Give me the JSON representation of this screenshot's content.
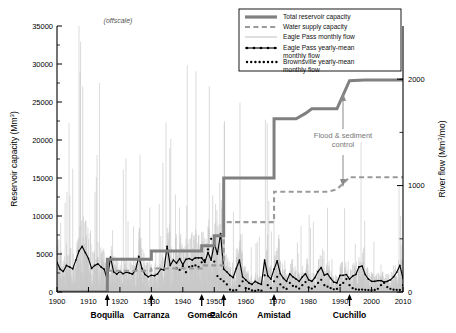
{
  "figure": {
    "offscale_note": "(offscale)",
    "annotation": {
      "line1": "Flood & sediment",
      "line2": "control"
    }
  },
  "axes": {
    "left": {
      "title": "Reservoir capacity (Mm",
      "title_sup": "3",
      "title_end": ")",
      "ticks": [
        "0",
        "5000",
        "10000",
        "15000",
        "20000",
        "25000",
        "30000",
        "35000"
      ],
      "min": 0,
      "max": 35000
    },
    "right": {
      "title": "River flow (Mm",
      "title_sup": "3",
      "title_end": "/mo)",
      "ticks": [
        "0",
        "1000",
        "2000"
      ],
      "min": 0,
      "max": 2500
    },
    "bottom": {
      "ticks": [
        "1900",
        "1910",
        "1920",
        "1930",
        "1940",
        "1950",
        "1960",
        "1970",
        "1980",
        "1990",
        "2000",
        "2010"
      ],
      "min": 1900,
      "max": 2010
    }
  },
  "dams": [
    {
      "label": "Boquilla",
      "year": 1916
    },
    {
      "label": "Carranza",
      "year": 1930
    },
    {
      "label": "Gomez",
      "year": 1946
    },
    {
      "label": "Falcón",
      "year": 1953
    },
    {
      "label": "Amistad",
      "year": 1969
    },
    {
      "label": "Cuchillo",
      "year": 1993
    }
  ],
  "legend": {
    "items": [
      {
        "label": "Total reservoir capacity",
        "style": "solid-thick-gray"
      },
      {
        "label": "Water supply capacity",
        "style": "dashed-gray"
      },
      {
        "label": "Eagle Pass monthly flow",
        "style": "thin-lightgray"
      },
      {
        "label": "Eagle Pass yearly-mean monthly flow",
        "style": "solid-black-markers"
      },
      {
        "label": "Brownsville yearly-mean monthly flow",
        "style": "dotted-black"
      }
    ]
  },
  "colors": {
    "total_capacity": "#808080",
    "water_supply": "#9a9a9a",
    "monthly_flow": "#c8c8c8",
    "yearly_mean": "#000000",
    "brownsville": "#000000",
    "annotation": "#808080"
  },
  "chart_data": {
    "type": "line",
    "title": "",
    "xlabel": "",
    "ylabel": "Reservoir capacity (Mm3)",
    "ylabel_right": "River flow (Mm3/mo)",
    "xlim": [
      1900,
      2010
    ],
    "ylim": [
      0,
      35000
    ],
    "ylim_right": [
      0,
      2500
    ],
    "grid": false,
    "legend_position": "top-right",
    "series": [
      {
        "name": "Total reservoir capacity",
        "axis": "left",
        "type": "step",
        "points": [
          [
            1900,
            0
          ],
          [
            1916,
            0
          ],
          [
            1916,
            4300
          ],
          [
            1930,
            4300
          ],
          [
            1930,
            5400
          ],
          [
            1946,
            5400
          ],
          [
            1946,
            6100
          ],
          [
            1950,
            6100
          ],
          [
            1950,
            7400
          ],
          [
            1953,
            7400
          ],
          [
            1953,
            15000
          ],
          [
            1969,
            15000
          ],
          [
            1969,
            22800
          ],
          [
            1976,
            22800
          ],
          [
            1979,
            23500
          ],
          [
            1981,
            24100
          ],
          [
            1989,
            24100
          ],
          [
            1993,
            27800
          ],
          [
            1998,
            27900
          ],
          [
            2010,
            27900
          ]
        ]
      },
      {
        "name": "Water supply capacity",
        "axis": "left",
        "type": "step",
        "points": [
          [
            1916,
            2800
          ],
          [
            1930,
            2800
          ],
          [
            1930,
            3100
          ],
          [
            1946,
            3100
          ],
          [
            1946,
            3500
          ],
          [
            1953,
            3500
          ],
          [
            1953,
            9200
          ],
          [
            1969,
            9200
          ],
          [
            1969,
            13200
          ],
          [
            1986,
            13200
          ],
          [
            1989,
            13500
          ],
          [
            1993,
            15100
          ],
          [
            2010,
            15100
          ]
        ]
      },
      {
        "name": "Eagle Pass monthly flow",
        "axis": "right",
        "type": "impulse",
        "note": "dense light-gray monthly spikes spanning 1900-2010; several exceed the 35000 (offscale) top"
      },
      {
        "name": "Eagle Pass yearly-mean monthly flow",
        "axis": "left",
        "type": "line",
        "values": [
          3900,
          3000,
          2700,
          3500,
          3300,
          3050,
          4200,
          5400,
          6000,
          5200,
          4400,
          3100,
          3500,
          3700,
          3300,
          3000,
          1600,
          4600,
          2650,
          2350,
          2700,
          2400,
          2600,
          2500,
          2350,
          2900,
          4700,
          3100,
          2300,
          2000,
          2200,
          2150,
          2400,
          3000,
          2900,
          6000,
          3500,
          4200,
          3800,
          4400,
          3600,
          4300,
          4400,
          4200,
          4500,
          4500,
          4500,
          3900,
          5200,
          4200,
          6400,
          5000,
          7700,
          3000,
          2650,
          2200,
          1900,
          3100,
          4200,
          2000,
          1600,
          1200,
          1000,
          1400,
          1150,
          1000,
          4200,
          2150,
          1700,
          3000,
          4100,
          2400,
          1800,
          1400,
          2400,
          2000,
          1700,
          1400,
          2000,
          2400,
          1600,
          1400,
          1900,
          2700,
          3200,
          2200,
          2400,
          1800,
          1300,
          1200,
          2200,
          2200,
          2300,
          1700,
          2100,
          2300,
          3300,
          3400,
          2300,
          1700,
          1400,
          1400,
          1500,
          1500,
          1300,
          1400,
          1600,
          2000,
          2600,
          3500,
          1800
        ]
      },
      {
        "name": "Brownsville yearly-mean monthly flow",
        "axis": "left",
        "type": "dotted",
        "start_year": 1938,
        "values": [
          3100,
          2900,
          3400,
          2600,
          3300,
          3400,
          3500,
          3300,
          3900,
          4200,
          5600,
          7000,
          4000,
          2100,
          1700,
          1400,
          1000,
          300,
          200,
          250,
          800,
          1400,
          500,
          400,
          200,
          150,
          250,
          180,
          2200,
          900,
          500,
          1400,
          2000,
          1000,
          600,
          400,
          1200,
          800,
          700,
          450,
          900,
          1300,
          600,
          450,
          700,
          1200,
          1600,
          900,
          700,
          500,
          350,
          400,
          900,
          1200,
          1700,
          900,
          500,
          350,
          300,
          320,
          280,
          250,
          230,
          260,
          420,
          900,
          1200,
          650,
          420,
          300,
          280,
          260,
          900
        ]
      }
    ]
  }
}
